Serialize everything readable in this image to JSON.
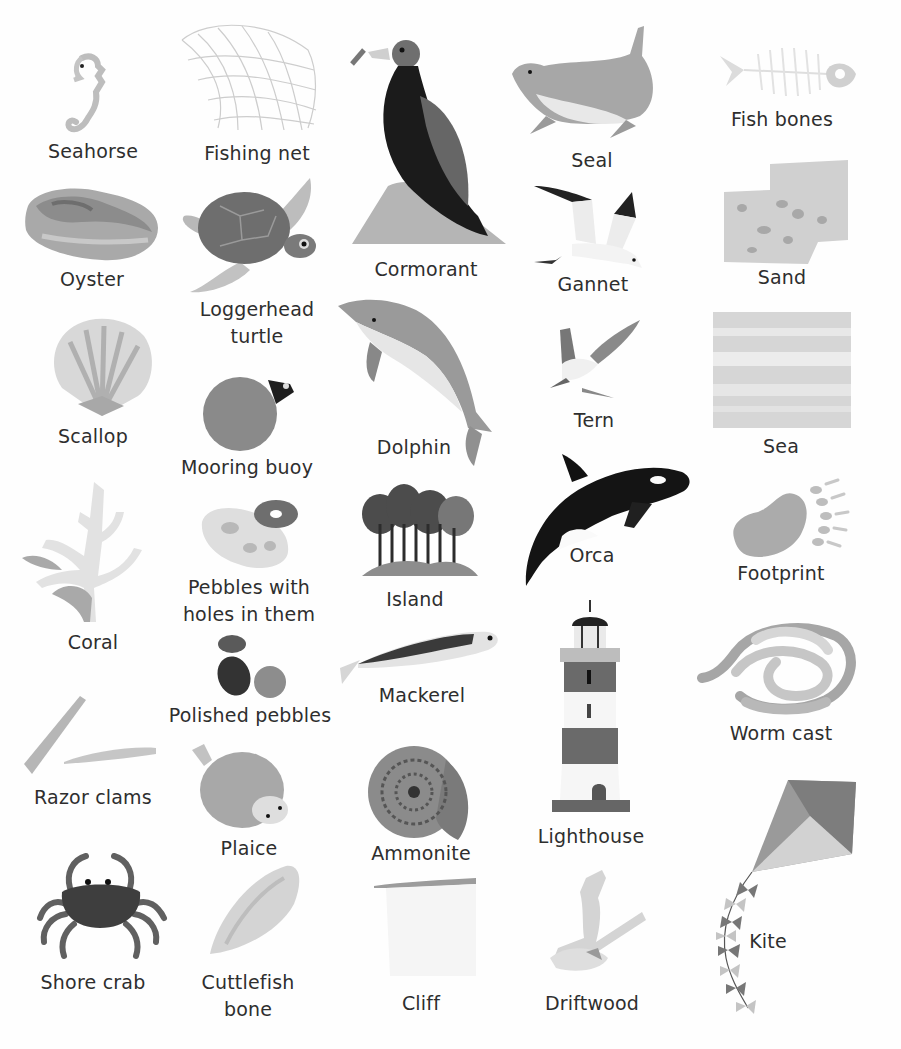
{
  "page": {
    "style": "grayscale illustrated picture glossary of seaside things",
    "background": "#ffffff",
    "text_color": "#2e2e2e"
  },
  "entries": {
    "seahorse": {
      "label": "Seahorse",
      "icon": "seahorse-icon"
    },
    "fishing_net": {
      "label": "Fishing net",
      "icon": "fishing-net-icon"
    },
    "cormorant": {
      "label": "Cormorant",
      "icon": "cormorant-icon"
    },
    "seal": {
      "label": "Seal",
      "icon": "seal-icon"
    },
    "fish_bones": {
      "label": "Fish bones",
      "icon": "fish-bones-icon"
    },
    "oyster": {
      "label": "Oyster",
      "icon": "oyster-icon"
    },
    "loggerhead_turtle": {
      "label_line1": "Loggerhead",
      "label_line2": "turtle",
      "icon": "turtle-icon"
    },
    "gannet": {
      "label": "Gannet",
      "icon": "gannet-icon"
    },
    "sand": {
      "label": "Sand",
      "icon": "sand-icon"
    },
    "scallop": {
      "label": "Scallop",
      "icon": "scallop-icon"
    },
    "dolphin": {
      "label": "Dolphin",
      "icon": "dolphin-icon"
    },
    "tern": {
      "label": "Tern",
      "icon": "tern-icon"
    },
    "sea": {
      "label": "Sea",
      "icon": "sea-icon"
    },
    "mooring_buoy": {
      "label": "Mooring buoy",
      "icon": "buoy-icon"
    },
    "orca": {
      "label": "Orca",
      "icon": "orca-icon"
    },
    "footprint": {
      "label": "Footprint",
      "icon": "footprint-icon"
    },
    "coral": {
      "label": "Coral",
      "icon": "coral-icon"
    },
    "pebbles_with_holes": {
      "label_line1": "Pebbles with",
      "label_line2": "holes in them",
      "icon": "holed-pebbles-icon"
    },
    "island": {
      "label": "Island",
      "icon": "island-icon"
    },
    "polished_pebbles": {
      "label": "Polished pebbles",
      "icon": "polished-pebbles-icon"
    },
    "mackerel": {
      "label": "Mackerel",
      "icon": "mackerel-icon"
    },
    "worm_cast": {
      "label": "Worm cast",
      "icon": "worm-cast-icon"
    },
    "razor_clams": {
      "label": "Razor clams",
      "icon": "razor-clams-icon"
    },
    "plaice": {
      "label": "Plaice",
      "icon": "plaice-icon"
    },
    "ammonite": {
      "label": "Ammonite",
      "icon": "ammonite-icon"
    },
    "lighthouse": {
      "label": "Lighthouse",
      "icon": "lighthouse-icon"
    },
    "kite": {
      "label": "Kite",
      "icon": "kite-icon"
    },
    "shore_crab": {
      "label": "Shore crab",
      "icon": "crab-icon"
    },
    "cuttlefish_bone": {
      "label_line1": "Cuttlefish",
      "label_line2": "bone",
      "icon": "cuttlefish-bone-icon"
    },
    "cliff": {
      "label": "Cliff",
      "icon": "cliff-icon"
    },
    "driftwood": {
      "label": "Driftwood",
      "icon": "driftwood-icon"
    }
  }
}
